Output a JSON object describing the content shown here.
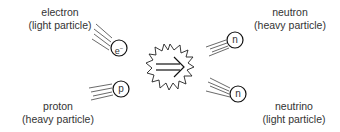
{
  "diagram": {
    "reaction_symbol": "implies-arrow",
    "particles": [
      {
        "id": "electron",
        "name": "electron",
        "type": "(light particle)",
        "symbol": "e",
        "superscript": "−",
        "role": "reactant"
      },
      {
        "id": "proton",
        "name": "proton",
        "type": "(heavy particle)",
        "symbol": "p",
        "role": "reactant"
      },
      {
        "id": "neutron",
        "name": "neutron",
        "type": "(heavy particle)",
        "symbol": "n",
        "role": "product"
      },
      {
        "id": "neutrino",
        "name": "neutrino",
        "type": "(light particle)",
        "symbol": "n",
        "role": "product"
      }
    ]
  }
}
